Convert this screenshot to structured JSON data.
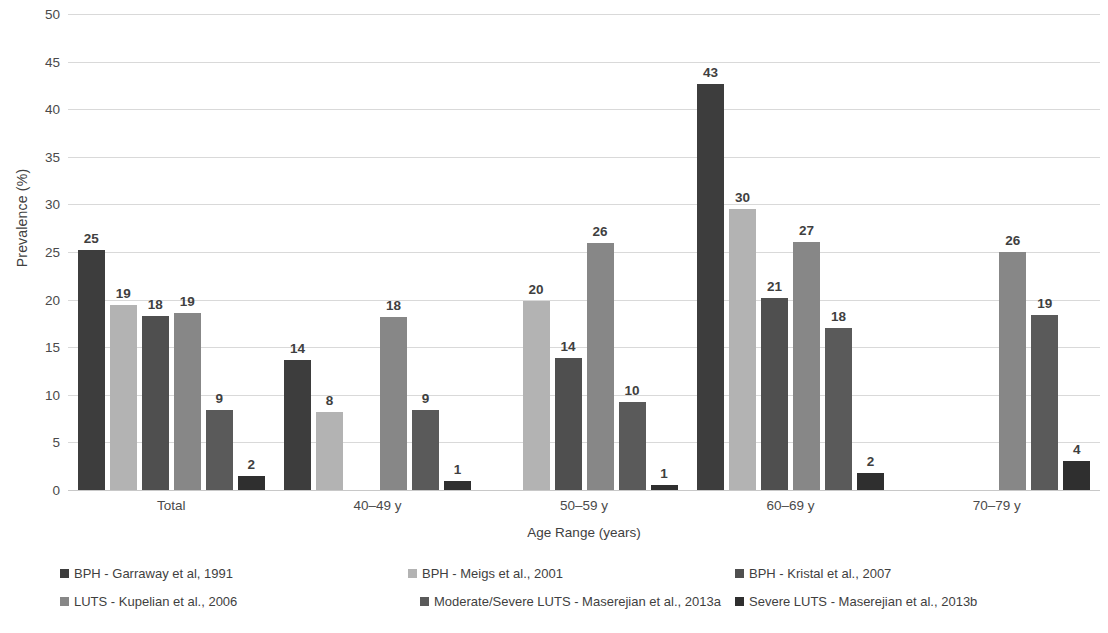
{
  "chart_data": {
    "type": "bar",
    "title": "",
    "xlabel": "Age Range (years)",
    "ylabel": "Prevalence (%)",
    "ylim": [
      0,
      50
    ],
    "yticks": [
      0,
      5,
      10,
      15,
      20,
      25,
      30,
      35,
      40,
      45,
      50
    ],
    "ytick_labels": [
      "0",
      "5",
      "10",
      "15",
      "20",
      "25",
      "30",
      "35",
      "40",
      "45",
      "50"
    ],
    "grid": true,
    "legend_position": "bottom",
    "categories": [
      "Total",
      "40–49 y",
      "50–59 y",
      "60–69 y",
      "70–79 y"
    ],
    "series": [
      {
        "name": "BPH - Garraway et al, 1991",
        "color": "#3d3d3d",
        "values": [
          25.2,
          13.7,
          null,
          42.7,
          null
        ],
        "labels": [
          "25",
          "14",
          "",
          "43",
          ""
        ]
      },
      {
        "name": "BPH - Meigs et al., 2001",
        "color": "#b3b3b3",
        "values": [
          19.4,
          8.2,
          19.9,
          29.5,
          null
        ],
        "labels": [
          "19",
          "8",
          "20",
          "30",
          ""
        ]
      },
      {
        "name": "BPH - Kristal et al., 2007",
        "color": "#4f4f4f",
        "values": [
          18.3,
          null,
          13.9,
          20.2,
          null
        ],
        "labels": [
          "18",
          "",
          "14",
          "21",
          ""
        ]
      },
      {
        "name": "LUTS - Kupelian et al., 2006",
        "color": "#878787",
        "values": [
          18.6,
          18.2,
          25.9,
          26.1,
          25.0
        ],
        "labels": [
          "19",
          "18",
          "26",
          "27",
          "26"
        ]
      },
      {
        "name": "Moderate/Severe LUTS - Maserejian et al., 2013a",
        "color": "#5a5a5a",
        "values": [
          8.4,
          8.4,
          9.2,
          17.0,
          18.4
        ],
        "labels": [
          "9",
          "9",
          "10",
          "18",
          "19"
        ]
      },
      {
        "name": "Severe LUTS - Maserejian et al., 2013b",
        "color": "#2f2f2f",
        "values": [
          1.5,
          0.9,
          0.5,
          1.8,
          3.1
        ],
        "labels": [
          "2",
          "1",
          "1",
          "2",
          "4"
        ]
      }
    ]
  },
  "legend": {
    "rows": [
      [
        {
          "label": "BPH - Garraway et al, 1991",
          "color": "#3d3d3d",
          "left": 60
        },
        {
          "label": "BPH - Meigs et al., 2001",
          "color": "#b3b3b3",
          "left": 408
        },
        {
          "label": "BPH - Kristal et al., 2007",
          "color": "#4f4f4f",
          "left": 735
        }
      ],
      [
        {
          "label": "LUTS - Kupelian et al., 2006",
          "color": "#878787",
          "left": 60
        },
        {
          "label": "Moderate/Severe LUTS - Maserejian et al., 2013a",
          "color": "#5a5a5a",
          "left": 420
        },
        {
          "label": "Severe LUTS - Maserejian et al., 2013b",
          "color": "#2f2f2f",
          "left": 735
        }
      ]
    ]
  }
}
